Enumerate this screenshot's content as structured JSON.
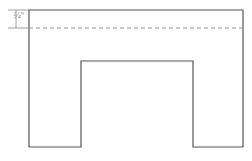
{
  "diagram": {
    "dimension_label": "¼\"",
    "outline_color": "#555555",
    "dashed_line_color": "#999999",
    "dimension_line_color": "#888888",
    "shape": {
      "outer_left": 29,
      "outer_right": 243,
      "top": 10,
      "bottom": 147,
      "notch_left": 81,
      "notch_right": 193,
      "notch_top": 61,
      "dashed_line_y": 28
    }
  }
}
